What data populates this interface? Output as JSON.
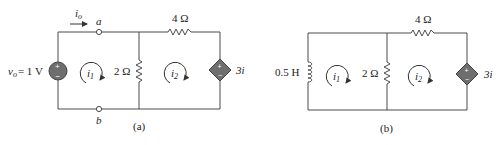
{
  "figure_a": {
    "caption": "(a)",
    "current_label": "i",
    "current_sub": "o",
    "node_a": "a",
    "node_b": "b",
    "source_label_var": "v",
    "source_label_sub": "o",
    "source_label_value": "= 1 V",
    "source_plus": "+",
    "source_minus": "−",
    "resistor_top": "4 Ω",
    "resistor_mid": "2 Ω",
    "mesh1": "i",
    "mesh1_sub": "1",
    "mesh2": "i",
    "mesh2_sub": "2",
    "dep_source_label": "3i",
    "dep_plus": "+",
    "dep_minus": "−"
  },
  "figure_b": {
    "caption": "(b)",
    "inductor_label": "0.5 H",
    "resistor_top": "4 Ω",
    "resistor_mid": "2 Ω",
    "mesh1": "i",
    "mesh1_sub": "1",
    "mesh2": "i",
    "mesh2_sub": "2",
    "dep_source_label": "3i",
    "dep_plus": "+",
    "dep_minus": "−"
  },
  "colors": {
    "wire": "#4a4a4a",
    "source_fill": "#6e6e6e",
    "text": "#222222"
  }
}
